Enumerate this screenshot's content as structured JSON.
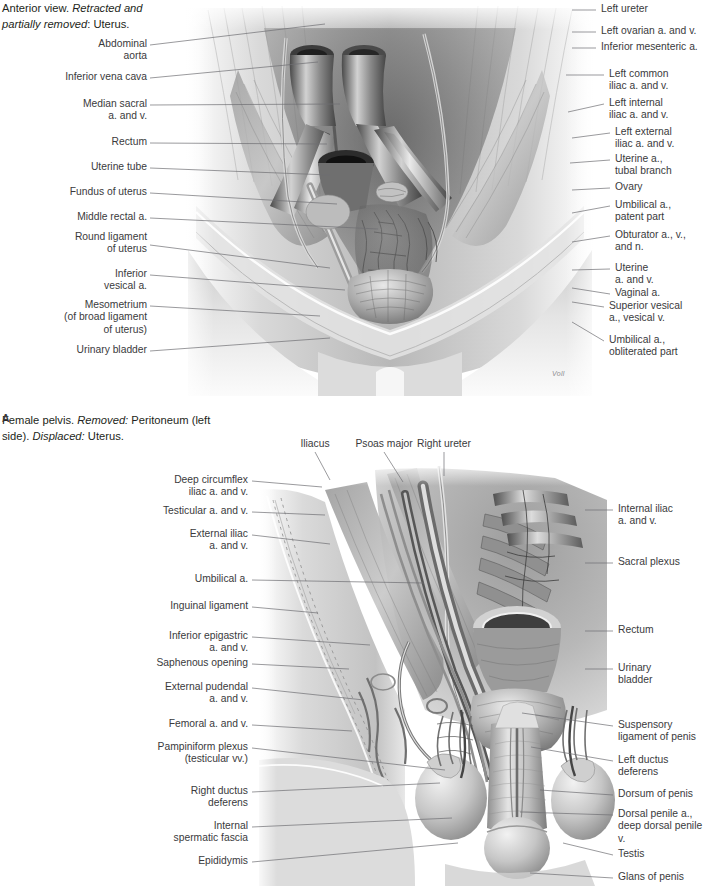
{
  "page": {
    "width": 710,
    "height": 886,
    "background": "#ffffff",
    "ink": "#231f20",
    "leader_color": "#6e6e72",
    "label_color": "#3a3a3c"
  },
  "header": {
    "line1_plain": "Anterior view. ",
    "line1_italic": "Retracted and",
    "line2_italic": "partially removed",
    "line2_plain": ": Uterus."
  },
  "caption_a": {
    "letter": "A",
    "text1": "Female pelvis. ",
    "italic1": "Removed:",
    "text2": " Peritoneum (left",
    "text3": "side). ",
    "italic2": "Displaced:",
    "text4": " Uterus."
  },
  "signature": "Voll",
  "figure_a": {
    "name": "female-pelvis-anterior-view",
    "labels_left": [
      {
        "id": "abdominal-aorta",
        "text": "Abdominal\naorta",
        "x": 32,
        "y": 38,
        "w": 115,
        "tip_x": 150,
        "tip_y": 45,
        "end_x": 325,
        "end_y": 24
      },
      {
        "id": "inferior-vena-cava",
        "text": "Inferior vena cava",
        "x": 32,
        "y": 71,
        "w": 115,
        "tip_x": 150,
        "tip_y": 78,
        "end_x": 318,
        "end_y": 62
      },
      {
        "id": "median-sacral-av",
        "text": "Median sacral\na. and v.",
        "x": 32,
        "y": 98,
        "w": 115,
        "tip_x": 150,
        "tip_y": 105,
        "end_x": 340,
        "end_y": 104
      },
      {
        "id": "rectum-a",
        "text": "Rectum",
        "x": 32,
        "y": 136,
        "w": 115,
        "tip_x": 150,
        "tip_y": 143,
        "end_x": 327,
        "end_y": 144
      },
      {
        "id": "uterine-tube",
        "text": "Uterine tube",
        "x": 32,
        "y": 161,
        "w": 115,
        "tip_x": 150,
        "tip_y": 168,
        "end_x": 330,
        "end_y": 175
      },
      {
        "id": "fundus-of-uterus",
        "text": "Fundus of uterus",
        "x": 32,
        "y": 186,
        "w": 115,
        "tip_x": 150,
        "tip_y": 193,
        "end_x": 337,
        "end_y": 204
      },
      {
        "id": "middle-rectal-a",
        "text": "Middle rectal a.",
        "x": 32,
        "y": 211,
        "w": 115,
        "tip_x": 150,
        "tip_y": 218,
        "end_x": 378,
        "end_y": 229
      },
      {
        "id": "round-ligament-uterus",
        "text": "Round ligament\nof uterus",
        "x": 32,
        "y": 231,
        "w": 115,
        "tip_x": 150,
        "tip_y": 245,
        "end_x": 330,
        "end_y": 268
      },
      {
        "id": "inferior-vesical-a",
        "text": "Inferior\nvesical a.",
        "x": 32,
        "y": 268,
        "w": 115,
        "tip_x": 150,
        "tip_y": 275,
        "end_x": 345,
        "end_y": 290
      },
      {
        "id": "mesometrium",
        "text": "Mesometrium\n(of broad ligament\nof uterus)",
        "x": 24,
        "y": 299,
        "w": 123,
        "tip_x": 150,
        "tip_y": 306,
        "end_x": 320,
        "end_y": 316
      },
      {
        "id": "urinary-bladder-a",
        "text": "Urinary bladder",
        "x": 32,
        "y": 344,
        "w": 115,
        "tip_x": 150,
        "tip_y": 351,
        "end_x": 330,
        "end_y": 338
      }
    ],
    "labels_right": [
      {
        "id": "left-ureter",
        "text": "Left ureter",
        "x": 601,
        "y": 3,
        "w": 109,
        "tip_x": 596,
        "tip_y": 10,
        "end_x": 572,
        "end_y": 10
      },
      {
        "id": "left-ovarian-av",
        "text": "Left ovarian a. and v.",
        "x": 601,
        "y": 25,
        "w": 109,
        "tip_x": 596,
        "tip_y": 32,
        "end_x": 572,
        "end_y": 32
      },
      {
        "id": "inferior-mesenteric-a",
        "text": "Inferior mesenteric a.",
        "x": 601,
        "y": 41,
        "w": 109,
        "tip_x": 596,
        "tip_y": 48,
        "end_x": 572,
        "end_y": 48
      },
      {
        "id": "left-common-iliac-av",
        "text": "Left common\niliac a. and v.",
        "x": 609,
        "y": 68,
        "w": 101,
        "tip_x": 604,
        "tip_y": 75,
        "end_x": 566,
        "end_y": 75
      },
      {
        "id": "left-internal-iliac-av",
        "text": "Left internal\niliac a. and v.",
        "x": 609,
        "y": 97,
        "w": 101,
        "tip_x": 604,
        "tip_y": 104,
        "end_x": 568,
        "end_y": 112
      },
      {
        "id": "left-external-iliac-av",
        "text": "Left external\niliac a. and v.",
        "x": 615,
        "y": 126,
        "w": 95,
        "tip_x": 610,
        "tip_y": 133,
        "end_x": 572,
        "end_y": 138
      },
      {
        "id": "uterine-a-tubal-branch",
        "text": "Uterine a.,\ntubal branch",
        "x": 615,
        "y": 153,
        "w": 95,
        "tip_x": 610,
        "tip_y": 160,
        "end_x": 570,
        "end_y": 163
      },
      {
        "id": "ovary",
        "text": "Ovary",
        "x": 615,
        "y": 181,
        "w": 95,
        "tip_x": 610,
        "tip_y": 188,
        "end_x": 572,
        "end_y": 190
      },
      {
        "id": "umbilical-a-patent",
        "text": "Umbilical a.,\npatent part",
        "x": 615,
        "y": 199,
        "w": 95,
        "tip_x": 610,
        "tip_y": 206,
        "end_x": 572,
        "end_y": 213
      },
      {
        "id": "obturator-avn",
        "text": "Obturator a., v.,\nand n.",
        "x": 615,
        "y": 229,
        "w": 95,
        "tip_x": 610,
        "tip_y": 236,
        "end_x": 572,
        "end_y": 242
      },
      {
        "id": "uterine-av",
        "text": "Uterine\na. and v.",
        "x": 615,
        "y": 262,
        "w": 95,
        "tip_x": 610,
        "tip_y": 269,
        "end_x": 572,
        "end_y": 270
      },
      {
        "id": "vaginal-a",
        "text": "Vaginal a.",
        "x": 615,
        "y": 287,
        "w": 95,
        "tip_x": 610,
        "tip_y": 294,
        "end_x": 572,
        "end_y": 288
      },
      {
        "id": "superior-vesical-a",
        "text": "Superior vesical\na., vesical v.",
        "x": 609,
        "y": 300,
        "w": 101,
        "tip_x": 604,
        "tip_y": 307,
        "end_x": 572,
        "end_y": 302
      },
      {
        "id": "umbilical-a-obliterated",
        "text": "Umbilical a.,\nobliterated part",
        "x": 609,
        "y": 334,
        "w": 101,
        "tip_x": 604,
        "tip_y": 341,
        "end_x": 572,
        "end_y": 322
      }
    ]
  },
  "figure_b": {
    "name": "male-pelvis-inguinal-region",
    "labels_top": [
      {
        "id": "iliacus",
        "text": "Iliacus",
        "x": 288,
        "y": 438,
        "w": 54,
        "tip_x": 315,
        "tip_y": 452,
        "end_x": 330,
        "end_y": 480
      },
      {
        "id": "psoas-major",
        "text": "Psoas major",
        "x": 345,
        "y": 438,
        "w": 78,
        "tip_x": 384,
        "tip_y": 452,
        "end_x": 403,
        "end_y": 482
      },
      {
        "id": "right-ureter",
        "text": "Right ureter",
        "x": 405,
        "y": 438,
        "w": 78,
        "tip_x": 444,
        "tip_y": 452,
        "end_x": 444,
        "end_y": 476
      }
    ],
    "labels_left": [
      {
        "id": "deep-circumflex-iliac-av",
        "text": "Deep circumflex\niliac a. and v.",
        "x": 110,
        "y": 474,
        "w": 138,
        "tip_x": 252,
        "tip_y": 481,
        "end_x": 322,
        "end_y": 487
      },
      {
        "id": "testicular-av",
        "text": "Testicular a. and v.",
        "x": 110,
        "y": 505,
        "w": 138,
        "tip_x": 252,
        "tip_y": 512,
        "end_x": 325,
        "end_y": 515
      },
      {
        "id": "external-iliac-av",
        "text": "External iliac\na. and v.",
        "x": 110,
        "y": 528,
        "w": 138,
        "tip_x": 252,
        "tip_y": 535,
        "end_x": 330,
        "end_y": 544
      },
      {
        "id": "umbilical-a-b",
        "text": "Umbilical a.",
        "x": 110,
        "y": 573,
        "w": 138,
        "tip_x": 252,
        "tip_y": 580,
        "end_x": 424,
        "end_y": 583
      },
      {
        "id": "inguinal-ligament",
        "text": "Inguinal ligament",
        "x": 110,
        "y": 600,
        "w": 138,
        "tip_x": 252,
        "tip_y": 607,
        "end_x": 318,
        "end_y": 613
      },
      {
        "id": "inferior-epigastric-av",
        "text": "Inferior epigastric\na. and v.",
        "x": 110,
        "y": 630,
        "w": 138,
        "tip_x": 252,
        "tip_y": 637,
        "end_x": 370,
        "end_y": 645
      },
      {
        "id": "saphenous-opening",
        "text": "Saphenous opening",
        "x": 110,
        "y": 657,
        "w": 138,
        "tip_x": 252,
        "tip_y": 664,
        "end_x": 349,
        "end_y": 669
      },
      {
        "id": "external-pudendal-av",
        "text": "External pudendal\na. and v.",
        "x": 110,
        "y": 681,
        "w": 138,
        "tip_x": 252,
        "tip_y": 688,
        "end_x": 364,
        "end_y": 700
      },
      {
        "id": "femoral-av",
        "text": "Femoral a. and v.",
        "x": 110,
        "y": 718,
        "w": 138,
        "tip_x": 252,
        "tip_y": 725,
        "end_x": 352,
        "end_y": 731
      },
      {
        "id": "pampiniform-plexus",
        "text": "Pampiniform plexus\n(testicular vv.)",
        "x": 105,
        "y": 741,
        "w": 143,
        "tip_x": 252,
        "tip_y": 748,
        "end_x": 445,
        "end_y": 770
      },
      {
        "id": "right-ductus-deferens",
        "text": "Right ductus\ndeferens",
        "x": 110,
        "y": 785,
        "w": 138,
        "tip_x": 252,
        "tip_y": 792,
        "end_x": 440,
        "end_y": 783
      },
      {
        "id": "internal-spermatic-fascia",
        "text": "Internal\nspermatic fascia",
        "x": 110,
        "y": 820,
        "w": 138,
        "tip_x": 252,
        "tip_y": 827,
        "end_x": 452,
        "end_y": 818
      },
      {
        "id": "epididymis",
        "text": "Epididymis",
        "x": 110,
        "y": 855,
        "w": 138,
        "tip_x": 252,
        "tip_y": 862,
        "end_x": 458,
        "end_y": 843
      }
    ],
    "labels_right": [
      {
        "id": "internal-iliac-av-b",
        "text": "Internal iliac\na. and v.",
        "x": 618,
        "y": 503,
        "w": 92,
        "tip_x": 613,
        "tip_y": 510,
        "end_x": 585,
        "end_y": 510
      },
      {
        "id": "sacral-plexus",
        "text": "Sacral plexus",
        "x": 618,
        "y": 556,
        "w": 92,
        "tip_x": 613,
        "tip_y": 563,
        "end_x": 585,
        "end_y": 563
      },
      {
        "id": "rectum-b",
        "text": "Rectum",
        "x": 618,
        "y": 624,
        "w": 92,
        "tip_x": 613,
        "tip_y": 631,
        "end_x": 585,
        "end_y": 631
      },
      {
        "id": "urinary-bladder-b",
        "text": "Urinary\nbladder",
        "x": 618,
        "y": 662,
        "w": 92,
        "tip_x": 613,
        "tip_y": 669,
        "end_x": 585,
        "end_y": 669
      },
      {
        "id": "suspensory-ligament-penis",
        "text": "Suspensory\nligament of penis",
        "x": 618,
        "y": 719,
        "w": 92,
        "tip_x": 613,
        "tip_y": 726,
        "end_x": 522,
        "end_y": 713
      },
      {
        "id": "left-ductus-deferens",
        "text": "Left ductus\ndeferens",
        "x": 618,
        "y": 754,
        "w": 92,
        "tip_x": 613,
        "tip_y": 761,
        "end_x": 531,
        "end_y": 747
      },
      {
        "id": "dorsum-of-penis",
        "text": "Dorsum of penis",
        "x": 618,
        "y": 788,
        "w": 92,
        "tip_x": 613,
        "tip_y": 795,
        "end_x": 540,
        "end_y": 790
      },
      {
        "id": "dorsal-penile-vessels",
        "text": "Dorsal penile a.,\ndeep dorsal penile v.",
        "x": 618,
        "y": 808,
        "w": 92,
        "tip_x": 613,
        "tip_y": 815,
        "end_x": 520,
        "end_y": 812
      },
      {
        "id": "testis",
        "text": "Testis",
        "x": 618,
        "y": 848,
        "w": 92,
        "tip_x": 613,
        "tip_y": 855,
        "end_x": 563,
        "end_y": 843
      },
      {
        "id": "glans-of-penis",
        "text": "Glans of penis",
        "x": 618,
        "y": 871,
        "w": 92,
        "tip_x": 613,
        "tip_y": 878,
        "end_x": 530,
        "end_y": 873
      }
    ]
  }
}
